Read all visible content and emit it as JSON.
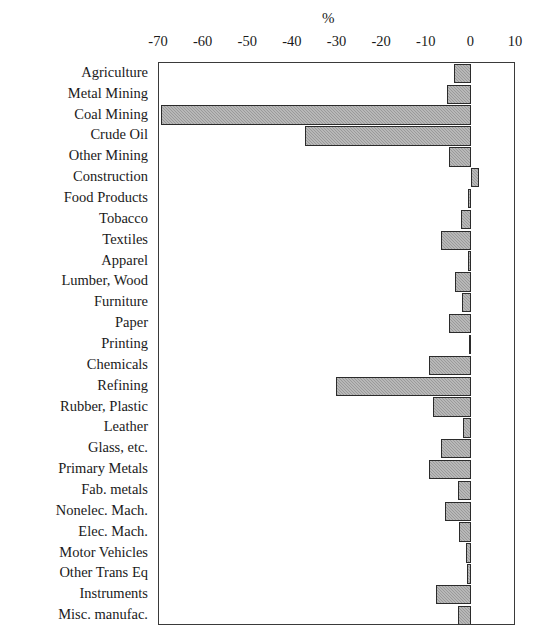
{
  "chart_data": {
    "type": "bar",
    "orientation": "horizontal",
    "title": "",
    "xlabel": "%",
    "ylabel": "",
    "xlim": [
      -70,
      10
    ],
    "xticks": [
      -70,
      -60,
      -50,
      -40,
      -30,
      -20,
      -10,
      0,
      10
    ],
    "xtick_labels": [
      "-70",
      "-60",
      "-50",
      "-40",
      "-30",
      "-20",
      "-10",
      "0",
      "10"
    ],
    "grid": false,
    "legend": false,
    "bar_color": "#9a9a9a",
    "bar_edge_color": "#2b2b2b",
    "categories": [
      "Agriculture",
      "Metal Mining",
      "Coal Mining",
      "Crude Oil",
      "Other Mining",
      "Construction",
      "Food Products",
      "Tobacco",
      "Textiles",
      "Apparel",
      "Lumber, Wood",
      "Furniture",
      "Paper",
      "Printing",
      "Chemicals",
      "Refining",
      "Rubber, Plastic",
      "Leather",
      "Glass, etc.",
      "Primary Metals",
      "Fab. metals",
      "Nonelec. Mach.",
      "Elec. Mach.",
      "Motor Vehicles",
      "Other Trans Eq",
      "Instruments",
      "Misc. manufac."
    ],
    "values": [
      -4.0,
      -5.4,
      -69.5,
      -37.3,
      -5.0,
      1.8,
      -0.7,
      -2.4,
      -6.7,
      -0.7,
      -3.6,
      -2.2,
      -5.1,
      -0.5,
      -9.4,
      -30.4,
      -8.5,
      -1.8,
      -6.7,
      -9.4,
      -3.1,
      -5.8,
      -2.7,
      -1.3,
      -0.9,
      -8.0,
      -3.1
    ]
  }
}
